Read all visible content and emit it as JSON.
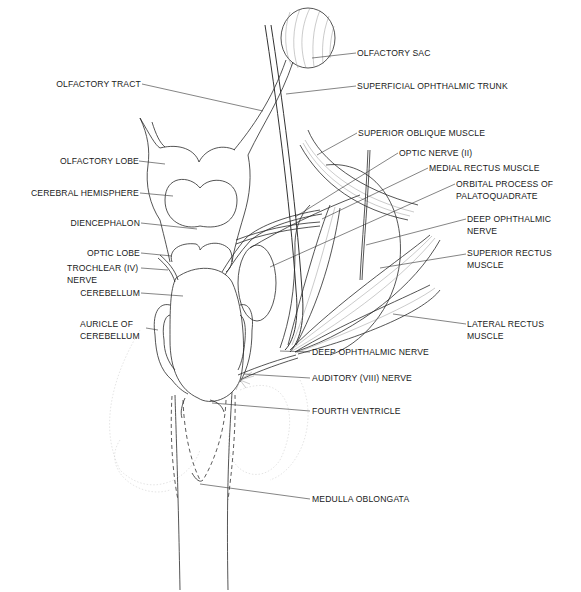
{
  "diagram": {
    "labels_left": [
      {
        "id": "olfactory-tract",
        "text": "OLFACTORY TRACT"
      },
      {
        "id": "olfactory-lobe",
        "text": "OLFACTORY LOBE"
      },
      {
        "id": "cerebral-hemisphere",
        "text": "CEREBRAL HEMISPHERE"
      },
      {
        "id": "diencephalon",
        "text": "DIENCEPHALON"
      },
      {
        "id": "optic-lobe",
        "text": "OPTIC LOBE"
      },
      {
        "id": "trochlear-nerve",
        "text": "TROCHLEAR (IV)",
        "text2": "NERVE"
      },
      {
        "id": "cerebellum",
        "text": "CEREBELLUM"
      },
      {
        "id": "auricle-of-cerebellum",
        "text": "AURICLE OF",
        "text2": "CEREBELLUM"
      }
    ],
    "labels_right": [
      {
        "id": "olfactory-sac",
        "text": "OLFACTORY SAC"
      },
      {
        "id": "superficial-ophthalmic-trunk",
        "text": "SUPERFICIAL OPHTHALMIC TRUNK"
      },
      {
        "id": "superior-oblique-muscle",
        "text": "SUPERIOR OBLIQUE MUSCLE"
      },
      {
        "id": "optic-nerve",
        "text": "OPTIC NERVE (II)"
      },
      {
        "id": "medial-rectus-muscle",
        "text": "MEDIAL RECTUS MUSCLE"
      },
      {
        "id": "orbital-process",
        "text": "ORBITAL PROCESS OF",
        "text2": "PALATOQUADRATE"
      },
      {
        "id": "deep-ophthalmic-nerve-upper",
        "text": "DEEP OPHTHALMIC",
        "text2": "NERVE"
      },
      {
        "id": "superior-rectus-muscle",
        "text": "SUPERIOR RECTUS",
        "text2": "MUSCLE"
      },
      {
        "id": "lateral-rectus-muscle",
        "text": "LATERAL RECTUS",
        "text2": "MUSCLE"
      },
      {
        "id": "deep-ophthalmic-nerve-lower",
        "text": "DEEP OPHTHALMIC NERVE"
      },
      {
        "id": "auditory-nerve",
        "text": "AUDITORY (VIII) NERVE"
      },
      {
        "id": "fourth-ventricle",
        "text": "FOURTH VENTRICLE"
      },
      {
        "id": "medulla-oblongata",
        "text": "MEDULLA OBLONGATA"
      }
    ]
  }
}
